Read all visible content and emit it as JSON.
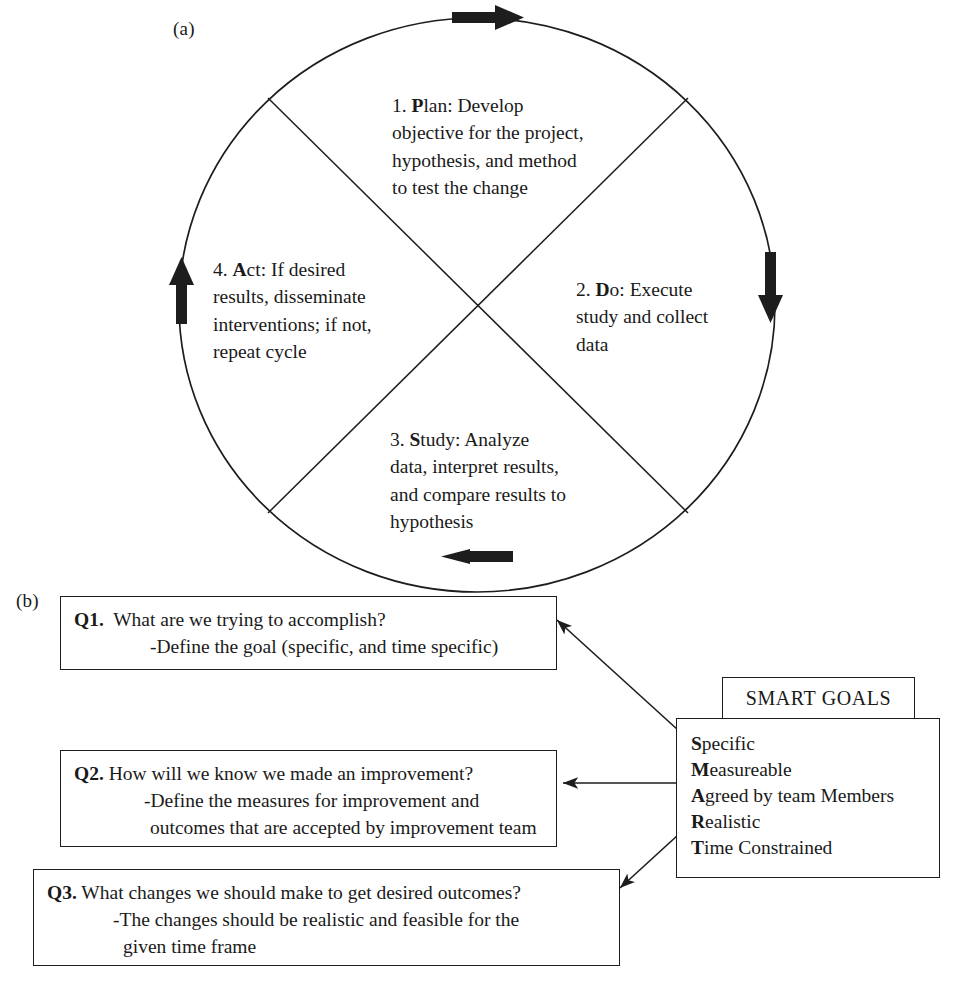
{
  "figure": {
    "panel_a_label": "(a)",
    "panel_b_label": "(b)"
  },
  "pdsa_cycle": {
    "quadrants": [
      {
        "number": "1.",
        "name_bold": "P",
        "name_rest": "lan",
        "full_label": "1. Plan",
        "text": "1. Plan: Develop\nobjective for the project,\nhypothesis, and method\nto test the change",
        "line1_prefix": "1. ",
        "line1_bold": "P",
        "line1_rest": "lan: Develop",
        "lines_rest": "objective for the project,\nhypothesis, and method\nto test the change"
      },
      {
        "number": "2.",
        "name_bold": "D",
        "name_rest": "o",
        "full_label": "2. Do",
        "text": "2. Do: Execute\nstudy and collect\ndata",
        "line1_prefix": "2. ",
        "line1_bold": "D",
        "line1_rest": "o: Execute",
        "lines_rest": "study and collect\ndata"
      },
      {
        "number": "3.",
        "name_bold": "S",
        "name_rest": "tudy",
        "full_label": "3. Study",
        "text": "3. Study: Analyze\ndata, interpret results,\nand compare results to\nhypothesis",
        "line1_prefix": "3. ",
        "line1_bold": "S",
        "line1_rest": "tudy: Analyze",
        "lines_rest": "data, interpret results,\nand compare results to\nhypothesis"
      },
      {
        "number": "4.",
        "name_bold": "A",
        "name_rest": "ct",
        "full_label": "4. Act",
        "text": "4. Act: If desired\nresults, disseminate\ninterventions; if not,\nrepeat cycle",
        "line1_prefix": "4. ",
        "line1_bold": "A",
        "line1_rest": "ct: If desired",
        "lines_rest": "results, disseminate\ninterventions; if not,\nrepeat cycle"
      }
    ],
    "direction_arrows": [
      {
        "name": "top-arrow",
        "direction": "right"
      },
      {
        "name": "right-arrow",
        "direction": "down"
      },
      {
        "name": "bottom-arrow",
        "direction": "left"
      },
      {
        "name": "left-arrow",
        "direction": "up"
      }
    ]
  },
  "questions": [
    {
      "label": "Q1.",
      "line1": "What are we trying to accomplish?",
      "line2": "-Define the goal (specific, and time specific)",
      "line3": ""
    },
    {
      "label": "Q2.",
      "line1": "How will we know we made an improvement?",
      "line2": "-Define the measures for improvement and",
      "line3": "outcomes that are accepted by improvement team"
    },
    {
      "label": "Q3.",
      "line1": "What changes we should make to get desired outcomes?",
      "line2": "-The changes should be realistic and feasible for the",
      "line3": "given time frame"
    }
  ],
  "smart_goals": {
    "header": "SMART GOALS",
    "items": [
      {
        "bold": "S",
        "rest": "pecific"
      },
      {
        "bold": "M",
        "rest": "easureable"
      },
      {
        "bold": "A",
        "rest": "greed by team Members"
      },
      {
        "bold": "R",
        "rest": "ealistic"
      },
      {
        "bold": "T",
        "rest": "ime Constrained"
      }
    ]
  },
  "colors": {
    "ink": "#1a1a1a",
    "line": "#1d1d1d",
    "background": "#ffffff"
  }
}
